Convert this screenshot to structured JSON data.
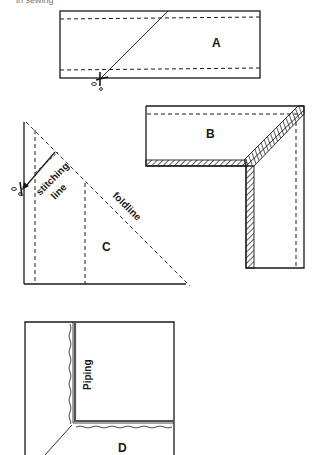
{
  "caption_fragment": "in sewing",
  "page_marker": "",
  "figures": [
    {
      "id": "A",
      "label": "A",
      "description": "Strip with two dashed stitching lines, cut diagonally"
    },
    {
      "id": "B",
      "label": "B",
      "description": "Mitred corner with hatched seam allowance"
    },
    {
      "id": "C",
      "label": "C",
      "annotations": [
        "stitching line",
        "foldline"
      ]
    },
    {
      "id": "D",
      "label": "D",
      "annotations": [
        "Piping"
      ]
    }
  ],
  "labels": {
    "a": "A",
    "b": "B",
    "c": "C",
    "d": "D",
    "stitching1": "stitching",
    "stitching2": "line",
    "foldline": "foldline",
    "piping": "Piping"
  },
  "colors": {
    "ink": "#1a1a1a",
    "paper": "#ffffff"
  }
}
